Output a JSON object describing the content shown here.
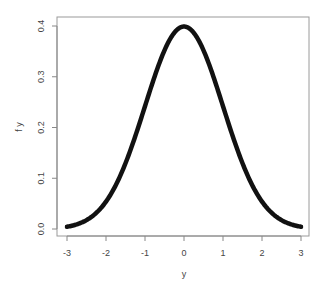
{
  "chart_data": {
    "type": "line",
    "title": "",
    "xlabel": "y",
    "ylabel": "f y",
    "xlim": [
      -3,
      3
    ],
    "ylim": [
      0,
      0.4
    ],
    "grid": false,
    "legend": null,
    "x_ticks": [
      -3,
      -2,
      -1,
      0,
      1,
      2,
      3
    ],
    "x_tick_labels": [
      "-3",
      "-2",
      "-1",
      "0",
      "1",
      "2",
      "3"
    ],
    "y_ticks": [
      0.0,
      0.1,
      0.2,
      0.3,
      0.4
    ],
    "y_tick_labels": [
      "0.0",
      "0.1",
      "0.2",
      "0.3",
      "0.4"
    ],
    "series": [
      {
        "name": "standard normal density",
        "color": "#111111",
        "x": [
          -3.0,
          -2.75,
          -2.5,
          -2.25,
          -2.0,
          -1.75,
          -1.5,
          -1.25,
          -1.0,
          -0.75,
          -0.5,
          -0.25,
          0.0,
          0.25,
          0.5,
          0.75,
          1.0,
          1.25,
          1.5,
          1.75,
          2.0,
          2.25,
          2.5,
          2.75,
          3.0
        ],
        "y": [
          0.0044,
          0.0091,
          0.0175,
          0.0317,
          0.054,
          0.0863,
          0.1295,
          0.1826,
          0.242,
          0.3011,
          0.3521,
          0.3867,
          0.3989,
          0.3867,
          0.3521,
          0.3011,
          0.242,
          0.1826,
          0.1295,
          0.0863,
          0.054,
          0.0317,
          0.0175,
          0.0091,
          0.0044
        ]
      }
    ]
  },
  "colors": {
    "axis": "#888888",
    "line": "#111111",
    "text": "#444444",
    "background": "#ffffff"
  }
}
